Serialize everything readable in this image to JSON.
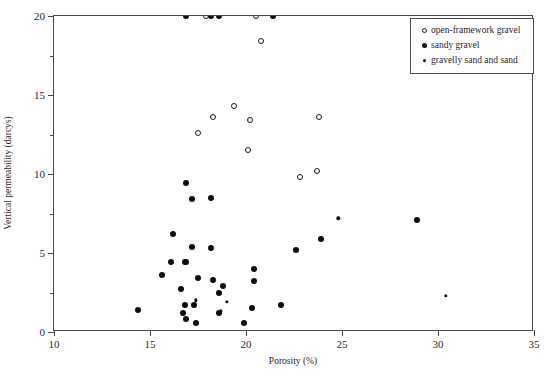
{
  "chart_data": {
    "type": "scatter",
    "title": "",
    "xlabel": "Porosity (%)",
    "ylabel": "Vertical permeability (darcys)",
    "xlim": [
      10,
      35
    ],
    "ylim": [
      0,
      20
    ],
    "xticks": [
      10,
      15,
      20,
      25,
      30,
      35
    ],
    "yticks": [
      0,
      5,
      10,
      15,
      20
    ],
    "y_minor_ticks": [
      2.5,
      7.5,
      12.5,
      17.5
    ],
    "grid": false,
    "legend_position": "top-right",
    "note": "Points at y=20 are clipped at the top axis (values at or above 20 darcys).",
    "series": [
      {
        "name": "open-framework gravel",
        "marker": "open-circle",
        "points": [
          [
            17.9,
            20.0
          ],
          [
            20.5,
            20.0
          ],
          [
            20.8,
            18.4
          ],
          [
            19.4,
            14.3
          ],
          [
            18.3,
            13.6
          ],
          [
            23.8,
            13.6
          ],
          [
            20.2,
            13.4
          ],
          [
            17.5,
            12.6
          ],
          [
            20.1,
            11.5
          ],
          [
            23.7,
            10.2
          ],
          [
            22.8,
            9.8
          ]
        ]
      },
      {
        "name": "sandy gravel",
        "marker": "filled-circle",
        "points": [
          [
            16.9,
            20.0
          ],
          [
            18.2,
            20.0
          ],
          [
            18.6,
            20.0
          ],
          [
            21.4,
            20.0
          ],
          [
            16.9,
            9.4
          ],
          [
            18.2,
            8.5
          ],
          [
            17.2,
            8.4
          ],
          [
            28.9,
            7.1
          ],
          [
            16.2,
            6.2
          ],
          [
            23.9,
            5.9
          ],
          [
            17.2,
            5.4
          ],
          [
            18.2,
            5.3
          ],
          [
            22.6,
            5.2
          ],
          [
            16.8,
            4.4
          ],
          [
            16.9,
            4.4
          ],
          [
            16.1,
            4.4
          ],
          [
            20.4,
            4.0
          ],
          [
            15.6,
            3.6
          ],
          [
            17.5,
            3.4
          ],
          [
            18.3,
            3.3
          ],
          [
            20.4,
            3.2
          ],
          [
            18.8,
            2.9
          ],
          [
            16.6,
            2.7
          ],
          [
            18.6,
            2.5
          ],
          [
            21.8,
            1.7
          ],
          [
            20.3,
            1.5
          ],
          [
            16.8,
            1.7
          ],
          [
            17.3,
            1.7
          ],
          [
            14.4,
            1.4
          ],
          [
            16.7,
            1.2
          ],
          [
            18.6,
            1.2
          ],
          [
            16.9,
            0.8
          ],
          [
            17.4,
            0.6
          ],
          [
            19.9,
            0.6
          ]
        ]
      },
      {
        "name": "gravelly sand and sand",
        "marker": "small-dot",
        "points": [
          [
            24.8,
            7.2
          ],
          [
            30.4,
            2.3
          ],
          [
            17.4,
            2.0
          ],
          [
            19.0,
            1.9
          ],
          [
            18.7,
            1.3
          ]
        ]
      }
    ]
  },
  "axes": {
    "x": {
      "title": "Porosity (%)",
      "tick_labels": [
        "10",
        "15",
        "20",
        "25",
        "30",
        "35"
      ]
    },
    "y": {
      "title": "Vertical permeability (darcys)",
      "tick_labels": [
        "0",
        "5",
        "10",
        "15",
        "20"
      ]
    }
  },
  "legend": {
    "entries": [
      {
        "label": "open-framework gravel",
        "marker": "open-circle"
      },
      {
        "label": "sandy gravel",
        "marker": "filled-circle"
      },
      {
        "label": "gravelly sand and sand",
        "marker": "small-dot"
      }
    ]
  }
}
